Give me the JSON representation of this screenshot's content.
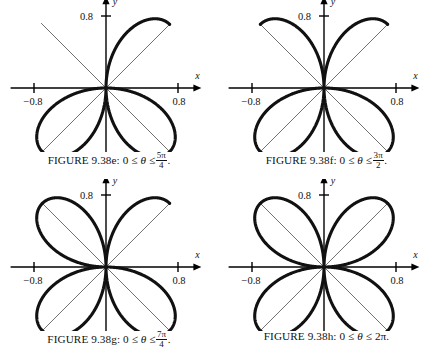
{
  "figure": {
    "group_id": "9.38",
    "curve_equation": "r = cos(2*theta)"
  },
  "chart_data": [
    {
      "type": "line",
      "panel_id": "e",
      "title": "FIGURE 9.38e",
      "curve": "r = cos(2θ)",
      "petal_axis_rotation_deg": 45,
      "theta_start": 0,
      "theta_end_label": "5π/4",
      "theta_end_numerator": "5π",
      "theta_end_denominator": "4",
      "theta_end_radians": 3.926990817,
      "petals_drawn": 2.5,
      "xlabel": "x",
      "ylabel": "y",
      "xlim": [
        -1.0,
        1.0
      ],
      "ylim": [
        -1.0,
        1.0
      ],
      "xticks": [
        -0.8,
        0.8
      ],
      "yticks": [
        -0.8,
        0.8
      ],
      "xtick_labels": [
        "−0.8",
        "0.8"
      ],
      "ytick_labels": [
        "−0.8",
        "0.8"
      ],
      "grid": false,
      "guide_lines_deg": [
        45,
        135
      ],
      "legend": null
    },
    {
      "type": "line",
      "panel_id": "f",
      "title": "FIGURE 9.38f",
      "curve": "r = cos(2θ)",
      "petal_axis_rotation_deg": 45,
      "theta_start": 0,
      "theta_end_label": "3π/2",
      "theta_end_numerator": "3π",
      "theta_end_denominator": "2",
      "theta_end_radians": 4.71238898,
      "petals_drawn": 3,
      "xlabel": "x",
      "ylabel": "y",
      "xlim": [
        -1.0,
        1.0
      ],
      "ylim": [
        -1.0,
        1.0
      ],
      "xticks": [
        -0.8,
        0.8
      ],
      "yticks": [
        -0.8,
        0.8
      ],
      "xtick_labels": [
        "−0.8",
        "0.8"
      ],
      "ytick_labels": [
        "−0.8",
        "0.8"
      ],
      "grid": false,
      "guide_lines_deg": [
        45,
        135
      ],
      "legend": null
    },
    {
      "type": "line",
      "panel_id": "g",
      "title": "FIGURE 9.38g",
      "curve": "r = cos(2θ)",
      "petal_axis_rotation_deg": 45,
      "theta_start": 0,
      "theta_end_label": "7π/4",
      "theta_end_numerator": "7π",
      "theta_end_denominator": "4",
      "theta_end_radians": 5.497787144,
      "petals_drawn": 3.5,
      "xlabel": "x",
      "ylabel": "y",
      "xlim": [
        -1.0,
        1.0
      ],
      "ylim": [
        -1.0,
        1.0
      ],
      "xticks": [
        -0.8,
        0.8
      ],
      "yticks": [
        -0.8,
        0.8
      ],
      "xtick_labels": [
        "−0.8",
        "0.8"
      ],
      "ytick_labels": [
        "−0.8",
        "0.8"
      ],
      "grid": false,
      "guide_lines_deg": [
        45,
        135
      ],
      "legend": null
    },
    {
      "type": "line",
      "panel_id": "h",
      "title": "FIGURE 9.38h",
      "curve": "r = cos(2θ)",
      "petal_axis_rotation_deg": 45,
      "theta_start": 0,
      "theta_end_label": "2π",
      "theta_end_numerator": null,
      "theta_end_denominator": null,
      "theta_end_radians": 6.283185307,
      "petals_drawn": 4,
      "xlabel": "x",
      "ylabel": "y",
      "xlim": [
        -1.0,
        1.0
      ],
      "ylim": [
        -1.0,
        1.0
      ],
      "xticks": [
        -0.8,
        0.8
      ],
      "yticks": [
        -0.8,
        0.8
      ],
      "xtick_labels": [
        "−0.8",
        "0.8"
      ],
      "ytick_labels": [
        "−0.8",
        "0.8"
      ],
      "grid": false,
      "guide_lines_deg": [
        45,
        135
      ],
      "legend": null
    }
  ],
  "panels": [
    {
      "caption_prefix": "FIGURE 9.38e: 0",
      "rel1": "≤",
      "theta": "θ",
      "rel2": "≤",
      "bound_num": "5π",
      "bound_den": "4",
      "bound_plain": null,
      "caption_suffix": ".",
      "axis_x_label": "x",
      "axis_y_label": "y",
      "x_neg_tick": "−0.8",
      "x_pos_tick": "0.8",
      "y_neg_tick": "−0.8",
      "y_pos_tick": "0.8"
    },
    {
      "caption_prefix": "FIGURE 9.38f: 0",
      "rel1": "≤",
      "theta": "θ",
      "rel2": "≤",
      "bound_num": "3π",
      "bound_den": "2",
      "bound_plain": null,
      "caption_suffix": ".",
      "axis_x_label": "x",
      "axis_y_label": "y",
      "x_neg_tick": "−0.8",
      "x_pos_tick": "0.8",
      "y_neg_tick": "−0.8",
      "y_pos_tick": "0.8"
    },
    {
      "caption_prefix": "FIGURE 9.38g: 0",
      "rel1": "≤",
      "theta": "θ",
      "rel2": "≤",
      "bound_num": "7π",
      "bound_den": "4",
      "bound_plain": null,
      "caption_suffix": ".",
      "axis_x_label": "x",
      "axis_y_label": "y",
      "x_neg_tick": "−0.8",
      "x_pos_tick": "0.8",
      "y_neg_tick": "−0.8",
      "y_pos_tick": "0.8"
    },
    {
      "caption_prefix": "FIGURE 9.38h: 0",
      "rel1": "≤",
      "theta": "θ",
      "rel2": "≤",
      "bound_num": null,
      "bound_den": null,
      "bound_plain": "2π",
      "caption_suffix": ".",
      "axis_x_label": "x",
      "axis_y_label": "y",
      "x_neg_tick": "−0.8",
      "x_pos_tick": "0.8",
      "y_neg_tick": "−0.8",
      "y_pos_tick": "0.8"
    }
  ],
  "style": {
    "curve_color": "#111111",
    "axis_color": "#000000",
    "guide_color": "#333333",
    "background": "#ffffff",
    "curve_stroke_width": 3.1,
    "axis_stroke_width": 1.4,
    "guide_stroke_width": 0.7
  }
}
